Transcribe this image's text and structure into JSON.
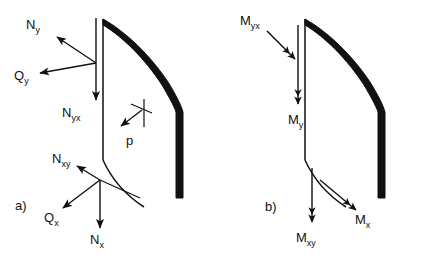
{
  "figure": {
    "background_color": "#ffffff",
    "ink_color": "#111111",
    "panels": [
      {
        "key": "a",
        "label": "a)",
        "caption": "Membrane forces and transverse shears on a curved shell element",
        "labels": [
          {
            "name": "N-y",
            "base": "N",
            "sub": "y",
            "text": "Ny",
            "arrow": "single",
            "direction": "up-left"
          },
          {
            "name": "Q-y",
            "base": "Q",
            "sub": "y",
            "text": "Qy",
            "arrow": "single",
            "direction": "left-down"
          },
          {
            "name": "N-yx",
            "base": "N",
            "sub": "yx",
            "text": "Nyx",
            "arrow": "single",
            "direction": "down"
          },
          {
            "name": "N-xy",
            "base": "N",
            "sub": "xy",
            "text": "Nxy",
            "arrow": "single",
            "direction": "up-left"
          },
          {
            "name": "Q-x",
            "base": "Q",
            "sub": "x",
            "text": "Qx",
            "arrow": "single",
            "direction": "down-left"
          },
          {
            "name": "N-x",
            "base": "N",
            "sub": "x",
            "text": "Nx",
            "arrow": "single",
            "direction": "down"
          },
          {
            "name": "p",
            "base": "p",
            "sub": "",
            "text": "p",
            "arrow": "single",
            "direction": "down-left"
          }
        ]
      },
      {
        "key": "b",
        "label": "b)",
        "caption": "Bending and twisting moments on a curved shell element",
        "labels": [
          {
            "name": "M-yx",
            "base": "M",
            "sub": "yx",
            "text": "Myx",
            "arrow": "double",
            "direction": "down-right"
          },
          {
            "name": "M-y",
            "base": "M",
            "sub": "y",
            "text": "My",
            "arrow": "double",
            "direction": "down"
          },
          {
            "name": "M-xy",
            "base": "M",
            "sub": "xy",
            "text": "Mxy",
            "arrow": "double",
            "direction": "down"
          },
          {
            "name": "M-x",
            "base": "M",
            "sub": "x",
            "text": "Mx",
            "arrow": "double",
            "direction": "down-right"
          }
        ]
      }
    ]
  }
}
